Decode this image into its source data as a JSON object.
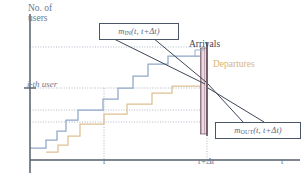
{
  "figure": {
    "kind": "queueing-cumulative-plot",
    "axes": {
      "y_label_line1": "No. of",
      "y_label_line2": "users",
      "x_axis_label": "t",
      "y_tick_label": "i-th user",
      "x_tick_labels": [
        "t",
        "t+Δt"
      ]
    },
    "annotations": {
      "arrivals": "Arrivals",
      "departures": "Departures"
    },
    "callouts": {
      "in": {
        "symbol": "m",
        "subscript": "IN",
        "args": "(t, t+Δt)"
      },
      "out": {
        "symbol": "m",
        "subscript": "OUT",
        "args": "(t, t+Δt)"
      }
    },
    "colors": {
      "arrivals_curve": "#8fa8c8",
      "departures_curve": "#ddc091",
      "arrivals_text": "#3b4354",
      "departures_text": "#d9b37a",
      "axis": "#555e6b",
      "gridline": "#9aa6b8",
      "callout_border": "#4a5668",
      "leader_line": "#3d4756",
      "band_fill": "#e8d7dd",
      "band_hatch": "#9a7f8c",
      "band_edge": "#5c4450"
    }
  },
  "chart_data": {
    "type": "line",
    "title": "",
    "xlabel": "t",
    "ylabel": "No. of users",
    "grid": true,
    "legend": [
      "Arrivals",
      "Departures"
    ],
    "xlim": [
      28,
      300
    ],
    "ylim": [
      150,
      20
    ],
    "series": [
      {
        "name": "Arrivals",
        "style": "staircase",
        "color": "#8fa8c8",
        "points": [
          [
            30,
            148
          ],
          [
            46,
            148
          ],
          [
            46,
            140
          ],
          [
            57,
            140
          ],
          [
            57,
            131
          ],
          [
            66,
            131
          ],
          [
            66,
            120
          ],
          [
            78,
            120
          ],
          [
            78,
            110
          ],
          [
            103,
            110
          ],
          [
            103,
            99
          ],
          [
            118,
            99
          ],
          [
            118,
            88
          ],
          [
            133,
            88
          ],
          [
            133,
            76
          ],
          [
            148,
            76
          ],
          [
            148,
            64
          ],
          [
            168,
            64
          ],
          [
            168,
            56
          ],
          [
            207,
            56
          ]
        ]
      },
      {
        "name": "Departures",
        "style": "staircase",
        "color": "#ddc091",
        "points": [
          [
            46,
            152
          ],
          [
            58,
            152
          ],
          [
            58,
            145
          ],
          [
            68,
            145
          ],
          [
            68,
            136
          ],
          [
            80,
            136
          ],
          [
            80,
            124
          ],
          [
            104,
            124
          ],
          [
            104,
            114
          ],
          [
            127,
            114
          ],
          [
            127,
            104
          ],
          [
            152,
            104
          ],
          [
            152,
            93
          ],
          [
            172,
            93
          ],
          [
            172,
            86
          ],
          [
            207,
            86
          ]
        ]
      }
    ],
    "gridlines_y": [
      47,
      88,
      110,
      122
    ],
    "gridlines_x": [
      104,
      207
    ],
    "y_tick_value": 88,
    "shaded_band": {
      "x_from": 200,
      "x_to": 207,
      "y_top": 56,
      "y_bottom": 86
    }
  }
}
